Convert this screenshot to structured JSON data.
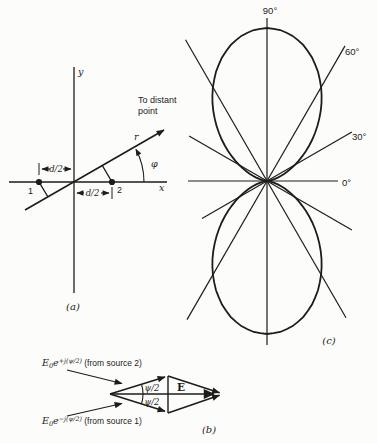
{
  "figure": {
    "background": "#fcfcfb",
    "ink": "#1c1c1c"
  },
  "diagram_a": {
    "caption": "(a)",
    "y_axis_label": "y",
    "x_axis_label": "x",
    "ray_label": "r",
    "angle_label": "φ",
    "annotation_line1": "To distant",
    "annotation_line2": "point",
    "spacing_left": "d/2",
    "spacing_right": "d/2",
    "source1_label": "1",
    "source2_label": "2"
  },
  "diagram_b": {
    "caption": "(b)",
    "phasor_top": {
      "E": "E",
      "sub": "0",
      "e": "e",
      "exp": "+j(ψ/2)",
      "note": " (from source 2)"
    },
    "phasor_bottom": {
      "E": "E",
      "sub": "0",
      "e": "e",
      "exp": "−j(ψ/2)",
      "note": " (from source 1)"
    },
    "angle_upper": "ψ/2",
    "angle_lower": "ψ/2",
    "resultant_label": "E"
  },
  "chart_data": {
    "type": "polar",
    "title": "",
    "caption": "(c)",
    "center_px": [
      267,
      181
    ],
    "radius_px": 153,
    "angle_labels": {
      "a90": "90°",
      "a60": "60°",
      "a30": "30°",
      "a0": "0°"
    },
    "rays_deg_len": [
      [
        0,
        71
      ],
      [
        30,
        98
      ],
      [
        60,
        156
      ],
      [
        90,
        163
      ],
      [
        120,
        163
      ],
      [
        150,
        90
      ],
      [
        180,
        79
      ],
      [
        210,
        75
      ],
      [
        240,
        160
      ],
      [
        270,
        164
      ],
      [
        300,
        158
      ],
      [
        330,
        98
      ]
    ],
    "pattern": {
      "angles_deg": [
        0,
        5,
        10,
        15,
        20,
        25,
        30,
        35,
        40,
        45,
        50,
        55,
        60,
        65,
        70,
        75,
        80,
        85,
        90
      ],
      "r": [
        0,
        0.006,
        0.024,
        0.053,
        0.095,
        0.147,
        0.209,
        0.28,
        0.359,
        0.444,
        0.532,
        0.621,
        0.707,
        0.788,
        0.859,
        0.919,
        0.963,
        0.991,
        1.0
      ]
    }
  }
}
